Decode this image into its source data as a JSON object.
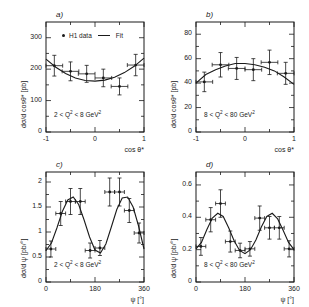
{
  "figure": {
    "legend": {
      "data_label": "H1 data",
      "fit_label": "Fit",
      "marker": "filled-circle",
      "line": "solid-line"
    }
  },
  "panels": [
    {
      "id": "a",
      "label": "a)",
      "cut": "2 < Q² < 8 GeV²",
      "xlabel": "cos θ*",
      "ylabel": "dσ/d cosθ*  [pb]",
      "xticks": [
        "-1",
        "0",
        "1"
      ],
      "yticks": [
        "0",
        "100",
        "200",
        "300"
      ],
      "chart_data": {
        "type": "scatter",
        "title": "a)",
        "xlabel": "cos θ*",
        "ylabel": "dσ/d cosθ* [pb]",
        "xlim": [
          -1,
          1
        ],
        "ylim": [
          0,
          350
        ],
        "grid": false,
        "annotation": "2 < Q² < 8 GeV²",
        "x": [
          -0.83,
          -0.5,
          -0.17,
          0.17,
          0.5,
          0.83
        ],
        "y": [
          211,
          193,
          185,
          172,
          145,
          213
        ],
        "yerr": [
          33,
          30,
          27,
          28,
          27,
          34
        ],
        "xerr": [
          0.17,
          0.17,
          0.17,
          0.17,
          0.17,
          0.17
        ],
        "fit": {
          "name": "Fit",
          "x": [
            -1,
            -0.8,
            -0.6,
            -0.4,
            -0.2,
            0,
            0.2,
            0.4,
            0.6,
            0.8,
            1
          ],
          "y": [
            232,
            206,
            186,
            172,
            164,
            162,
            165,
            174,
            189,
            209,
            235
          ]
        }
      }
    },
    {
      "id": "b",
      "label": "b)",
      "cut": "8 < Q² < 80 GeV²",
      "xlabel": "cos θ*",
      "ylabel": "dσ/d cosθ*  [pb]",
      "xticks": [
        "-1",
        "0",
        "1"
      ],
      "yticks": [
        "0",
        "20",
        "40",
        "60",
        "80"
      ],
      "chart_data": {
        "type": "scatter",
        "title": "b)",
        "xlabel": "cos θ*",
        "ylabel": "dσ/d cosθ* [pb]",
        "xlim": [
          -1,
          1
        ],
        "ylim": [
          0,
          90
        ],
        "grid": false,
        "annotation": "8 < Q² < 80 GeV²",
        "x": [
          -0.83,
          -0.5,
          -0.17,
          0.17,
          0.5,
          0.83
        ],
        "y": [
          41,
          55,
          52,
          51,
          57,
          48
        ],
        "yerr": [
          8,
          10,
          9,
          9,
          10,
          9
        ],
        "xerr": [
          0.17,
          0.17,
          0.17,
          0.17,
          0.17,
          0.17
        ],
        "fit": {
          "name": "Fit",
          "x": [
            -1,
            -0.8,
            -0.6,
            -0.4,
            -0.2,
            0,
            0.2,
            0.4,
            0.6,
            0.8,
            1
          ],
          "y": [
            40,
            47,
            51,
            54,
            56,
            56,
            55,
            53,
            50,
            45,
            39
          ]
        }
      }
    },
    {
      "id": "c",
      "label": "c)",
      "cut": "2 < Q² < 8 GeV²",
      "xlabel": "ψ [°]",
      "ylabel": "dσ/d ψ  [pb/°]",
      "xticks": [
        "0",
        "180",
        "360"
      ],
      "yticks": [
        "0",
        "0.5",
        "1",
        "1.5",
        "2"
      ],
      "chart_data": {
        "type": "scatter",
        "title": "c)",
        "xlabel": "ψ [°]",
        "ylabel": "dσ/d ψ [pb/°]",
        "xlim": [
          0,
          360
        ],
        "ylim": [
          0,
          2.2
        ],
        "grid": false,
        "annotation": "2 < Q² < 8 GeV²",
        "x": [
          18,
          54,
          90,
          126,
          162,
          198,
          234,
          270,
          306,
          342
        ],
        "y": [
          0.66,
          1.37,
          1.61,
          1.61,
          0.63,
          0.68,
          1.8,
          1.8,
          1.43,
          0.98
        ],
        "yerr": [
          0.16,
          0.24,
          0.26,
          0.26,
          0.15,
          0.15,
          0.28,
          0.28,
          0.24,
          0.2
        ],
        "xerr": [
          18,
          18,
          18,
          18,
          18,
          18,
          18,
          18,
          18,
          18
        ],
        "fit": {
          "name": "Fit",
          "x": [
            0,
            20,
            40,
            60,
            80,
            100,
            120,
            140,
            160,
            180,
            200,
            220,
            240,
            260,
            280,
            300,
            320,
            340,
            360
          ],
          "y": [
            0.63,
            0.78,
            1.08,
            1.41,
            1.64,
            1.7,
            1.55,
            1.24,
            0.9,
            0.64,
            0.58,
            0.76,
            1.1,
            1.45,
            1.68,
            1.7,
            1.5,
            1.12,
            0.66
          ]
        }
      }
    },
    {
      "id": "d",
      "label": "d)",
      "cut": "8 < Q² < 80 GeV²",
      "xlabel": "ψ [°]",
      "ylabel": "dσ/d ψ  [pb/°]",
      "xticks": [
        "0",
        "180",
        "360"
      ],
      "yticks": [
        "0",
        "0.2",
        "0.4",
        "0.6"
      ],
      "chart_data": {
        "type": "scatter",
        "title": "d)",
        "xlabel": "ψ [°]",
        "ylabel": "dσ/d ψ [pb/°]",
        "xlim": [
          0,
          360
        ],
        "ylim": [
          0,
          0.68
        ],
        "grid": false,
        "annotation": "8 < Q² < 80 GeV²",
        "x": [
          18,
          54,
          90,
          126,
          162,
          198,
          234,
          270,
          306,
          342
        ],
        "y": [
          0.22,
          0.385,
          0.485,
          0.25,
          0.195,
          0.205,
          0.395,
          0.335,
          0.335,
          0.205
        ],
        "yerr": [
          0.055,
          0.075,
          0.085,
          0.065,
          0.045,
          0.045,
          0.075,
          0.07,
          0.07,
          0.05
        ],
        "xerr": [
          18,
          18,
          18,
          18,
          18,
          18,
          18,
          18,
          18,
          18
        ],
        "fit": {
          "name": "Fit",
          "x": [
            0,
            20,
            40,
            60,
            80,
            100,
            120,
            140,
            160,
            180,
            200,
            220,
            240,
            260,
            280,
            300,
            320,
            340,
            360
          ],
          "y": [
            0.205,
            0.245,
            0.325,
            0.395,
            0.425,
            0.405,
            0.335,
            0.255,
            0.195,
            0.175,
            0.2,
            0.26,
            0.34,
            0.405,
            0.425,
            0.39,
            0.32,
            0.245,
            0.2
          ]
        }
      }
    }
  ]
}
